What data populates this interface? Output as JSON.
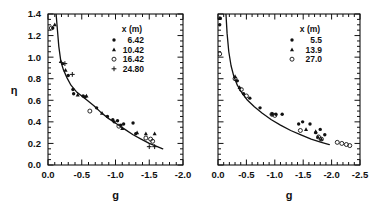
{
  "figure": {
    "background": "#ffffff",
    "ink": "#111111"
  },
  "chart_data": [
    {
      "type": "scatter",
      "panel": "left",
      "title": "",
      "xlabel": "g",
      "ylabel": "η",
      "xlim": [
        0.0,
        -2.0
      ],
      "ylim": [
        0.0,
        1.4
      ],
      "xticks": [
        0.0,
        -0.5,
        -1.0,
        -1.5,
        -2.0
      ],
      "xtick_labels": [
        "0.0",
        "-0.5",
        "-1.0",
        "-1.5",
        "-2.0"
      ],
      "yticks": [
        0.0,
        0.2,
        0.4,
        0.6,
        0.8,
        1.0,
        1.2,
        1.4
      ],
      "ytick_labels": [
        "0.0",
        "0.2",
        "0.4",
        "0.6",
        "0.8",
        "1.0",
        "1.2",
        "1.4"
      ],
      "x_minor_step": 0.1,
      "y_minor_step": 0.05,
      "grid": false,
      "legend_position": "top-right",
      "legend_title": "x (m)",
      "series": [
        {
          "name": "6.42",
          "marker": "dot",
          "points": [
            [
              -0.07,
              1.27
            ],
            [
              -0.22,
              0.94
            ],
            [
              -0.3,
              0.83
            ],
            [
              -0.37,
              0.7
            ],
            [
              -0.38,
              0.66
            ],
            [
              -0.52,
              0.64
            ],
            [
              -0.55,
              0.63
            ],
            [
              -0.72,
              0.53
            ],
            [
              -0.88,
              0.45
            ],
            [
              -0.96,
              0.42
            ],
            [
              -0.98,
              0.4
            ],
            [
              -1.03,
              0.41
            ],
            [
              -1.08,
              0.37
            ],
            [
              -1.12,
              0.38
            ],
            [
              -1.26,
              0.39
            ],
            [
              -1.3,
              0.29
            ]
          ]
        },
        {
          "name": "10.42",
          "marker": "triangle",
          "points": [
            [
              -0.1,
              1.3
            ],
            [
              -0.19,
              0.96
            ],
            [
              -0.26,
              0.88
            ],
            [
              -0.44,
              0.65
            ],
            [
              -0.57,
              0.64
            ],
            [
              -0.8,
              0.48
            ],
            [
              -1.1,
              0.34
            ],
            [
              -1.32,
              0.3
            ],
            [
              -1.45,
              0.29
            ],
            [
              -1.58,
              0.29
            ]
          ]
        },
        {
          "name": "16.42",
          "marker": "circle",
          "points": [
            [
              -0.05,
              1.27
            ],
            [
              -0.62,
              0.5
            ],
            [
              -1.05,
              0.36
            ],
            [
              -1.45,
              0.25
            ],
            [
              -1.52,
              0.24
            ],
            [
              -1.55,
              0.22
            ]
          ]
        },
        {
          "name": "24.80",
          "marker": "plus",
          "points": [
            [
              -0.25,
              0.94
            ],
            [
              -0.36,
              0.84
            ],
            [
              -1.5,
              0.17
            ],
            [
              -1.58,
              0.17
            ]
          ]
        }
      ],
      "curve": {
        "name": "model",
        "points": [
          [
            -0.12,
            1.4
          ],
          [
            -0.14,
            1.25
          ],
          [
            -0.16,
            1.1
          ],
          [
            -0.19,
            0.96
          ],
          [
            -0.23,
            0.88
          ],
          [
            -0.28,
            0.81
          ],
          [
            -0.34,
            0.74
          ],
          [
            -0.42,
            0.68
          ],
          [
            -0.5,
            0.64
          ],
          [
            -0.58,
            0.6
          ],
          [
            -0.68,
            0.55
          ],
          [
            -0.78,
            0.49
          ],
          [
            -0.9,
            0.43
          ],
          [
            -1.02,
            0.38
          ],
          [
            -1.14,
            0.33
          ],
          [
            -1.26,
            0.28
          ],
          [
            -1.38,
            0.24
          ],
          [
            -1.5,
            0.2
          ],
          [
            -1.62,
            0.17
          ],
          [
            -1.7,
            0.15
          ]
        ]
      }
    },
    {
      "type": "scatter",
      "panel": "right",
      "title": "",
      "xlabel": "g",
      "ylabel": "",
      "xlim": [
        0.0,
        -2.5
      ],
      "ylim": [
        0.0,
        1.4
      ],
      "xticks": [
        0.0,
        -0.5,
        -1.0,
        -1.5,
        -2.0,
        -2.5
      ],
      "xtick_labels": [
        "0.0",
        "-0.5",
        "-1.0",
        "-1.5",
        "-2.0",
        "-2.5"
      ],
      "yticks": [
        0.0,
        0.2,
        0.4,
        0.6,
        0.8,
        1.0,
        1.2,
        1.4
      ],
      "ytick_labels": [
        "",
        "",
        "",
        "",
        "",
        "",
        "",
        ""
      ],
      "x_minor_step": 0.1,
      "y_minor_step": 0.05,
      "grid": false,
      "legend_position": "top-right",
      "legend_title": "x (m)",
      "series": [
        {
          "name": "5.5",
          "marker": "dot",
          "points": [
            [
              -0.04,
              1.36
            ],
            [
              -0.03,
              1.3
            ],
            [
              -0.34,
              0.78
            ],
            [
              -0.45,
              0.66
            ],
            [
              -0.56,
              0.62
            ],
            [
              -0.74,
              0.53
            ],
            [
              -0.95,
              0.47
            ],
            [
              -1.02,
              0.47
            ],
            [
              -1.13,
              0.47
            ],
            [
              -1.42,
              0.38
            ],
            [
              -1.49,
              0.4
            ],
            [
              -1.62,
              0.38
            ],
            [
              -1.72,
              0.3
            ],
            [
              -1.8,
              0.33
            ],
            [
              -1.88,
              0.28
            ]
          ]
        },
        {
          "name": "13.9",
          "marker": "triangle",
          "points": [
            [
              -0.03,
              1.36
            ],
            [
              -0.3,
              0.82
            ],
            [
              -0.38,
              0.72
            ],
            [
              -1.55,
              0.33
            ],
            [
              -1.72,
              0.31
            ],
            [
              -1.76,
              0.26
            ],
            [
              -1.82,
              0.24
            ]
          ]
        },
        {
          "name": "27.0",
          "marker": "circle",
          "points": [
            [
              -0.03,
              1.03
            ],
            [
              -0.3,
              0.8
            ],
            [
              -0.41,
              0.7
            ],
            [
              -0.5,
              0.64
            ],
            [
              -0.95,
              0.47
            ],
            [
              -1.0,
              0.46
            ],
            [
              -1.45,
              0.32
            ],
            [
              -1.77,
              0.26
            ],
            [
              -1.82,
              0.24
            ],
            [
              -2.1,
              0.21
            ],
            [
              -2.18,
              0.2
            ],
            [
              -2.26,
              0.19
            ],
            [
              -2.32,
              0.18
            ]
          ]
        }
      ],
      "curve": {
        "name": "model",
        "points": [
          [
            -0.14,
            1.4
          ],
          [
            -0.16,
            1.22
          ],
          [
            -0.19,
            1.05
          ],
          [
            -0.23,
            0.92
          ],
          [
            -0.28,
            0.82
          ],
          [
            -0.34,
            0.74
          ],
          [
            -0.42,
            0.67
          ],
          [
            -0.52,
            0.6
          ],
          [
            -0.64,
            0.54
          ],
          [
            -0.78,
            0.48
          ],
          [
            -0.94,
            0.42
          ],
          [
            -1.1,
            0.37
          ],
          [
            -1.28,
            0.32
          ],
          [
            -1.46,
            0.28
          ],
          [
            -1.64,
            0.24
          ],
          [
            -1.82,
            0.21
          ],
          [
            -1.96,
            0.19
          ]
        ]
      }
    }
  ]
}
